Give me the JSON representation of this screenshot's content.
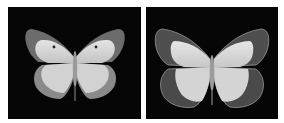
{
  "panels": [
    {
      "label": "butterfly-left",
      "subject": "butterfly, dorsal view, grayscale",
      "background": "#060606",
      "wing_light": "#d8d8d8",
      "wing_dark": "#6a6a6a"
    },
    {
      "label": "butterfly-right",
      "subject": "butterfly, dorsal view, grayscale",
      "background": "#060606",
      "wing_light": "#dcdcdc",
      "wing_dark": "#555555"
    }
  ]
}
